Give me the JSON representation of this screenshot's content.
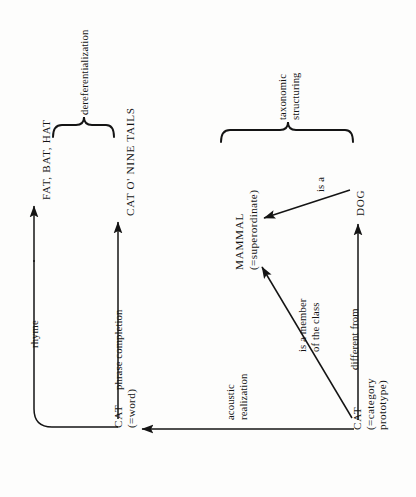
{
  "diagram": {
    "background_color": "#fdfdfc",
    "line_color": "#141414",
    "nodes": {
      "cat_word": {
        "label": "CAT",
        "sub": "(=word)"
      },
      "cat_prototype": {
        "label": "CAT",
        "sub_line1": "(=category",
        "sub_line2": "prototype)"
      },
      "mammal": {
        "label": "MAMMAL",
        "sub": "(=superordinate)"
      },
      "dog": {
        "label": "DOG"
      },
      "rhyme_target": {
        "label": "FAT, BAT, HAT"
      },
      "phrase_target": {
        "label": "CAT O' NINE TAILS"
      }
    },
    "edges": {
      "rhyme": {
        "label": "rhyme"
      },
      "phrase_completion": {
        "label": "phrase completion"
      },
      "acoustic_realization": {
        "label_line1": "acoustic",
        "label_line2": "realization"
      },
      "is_a_member_of_the_class": {
        "label_line1": "is a member",
        "label_line2": "of the class"
      },
      "different_from": {
        "label": "different from"
      },
      "is_a": {
        "label": "is a"
      }
    },
    "braces": {
      "dereferentialization": {
        "label": "dereferentialization"
      },
      "taxonomic_structuring": {
        "label_line1": "taxonomic",
        "label_line2": "structuring"
      }
    }
  }
}
